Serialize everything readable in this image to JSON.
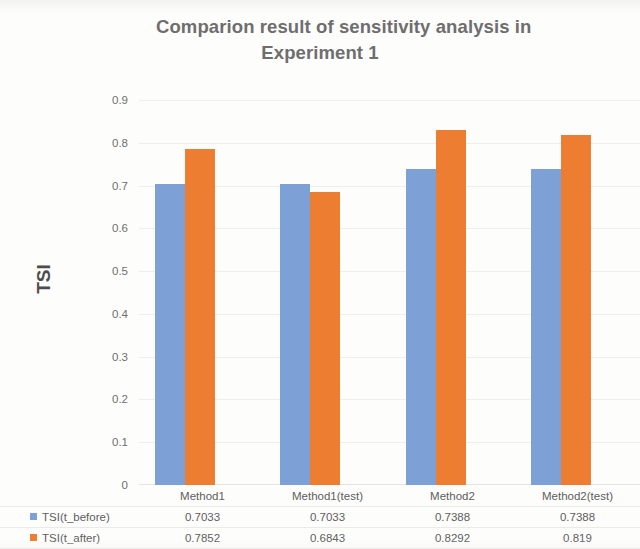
{
  "chart_data": {
    "type": "bar",
    "title": "Comparion result of sensitivity analysis in Experiment 1",
    "title_line1": "Comparion result of sensitivity analysis in",
    "title_line2": "Experiment 1",
    "xlabel": "",
    "ylabel": "TSI",
    "ylim": [
      0,
      0.9
    ],
    "ytick_labels": [
      "0.9",
      "0.8",
      "0.7",
      "0.6",
      "0.5",
      "0.4",
      "0.3",
      "0.2",
      "0.1",
      "0"
    ],
    "ytick_values": [
      0.9,
      0.8,
      0.7,
      0.6,
      0.5,
      0.4,
      0.3,
      0.2,
      0.1,
      0
    ],
    "grid": true,
    "legend_position": "data-table",
    "categories": [
      "Method1",
      "Method1(test)",
      "Method2",
      "Method2(test)"
    ],
    "series": [
      {
        "name": "TSI(t_before)",
        "color": "#7da0d6",
        "values": [
          0.7033,
          0.7033,
          0.7388,
          0.7388
        ],
        "labels": [
          "0.7033",
          "0.7033",
          "0.7388",
          "0.7388"
        ]
      },
      {
        "name": "TSI(t_after)",
        "color": "#ed7d31",
        "values": [
          0.7852,
          0.6843,
          0.8292,
          0.819
        ],
        "labels": [
          "0.7852",
          "0.6843",
          "0.8292",
          "0.819"
        ]
      }
    ]
  },
  "colors": {
    "series_before": "#7da0d6",
    "series_after": "#ed7d31",
    "title_text": "#6e6e6e",
    "axis_text": "#6f6f6f",
    "background": "#fdfdfc",
    "gridline": "#f0eeea"
  }
}
